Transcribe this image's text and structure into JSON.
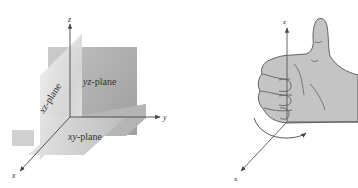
{
  "figure_left": {
    "title": "coordinate-planes",
    "axes": {
      "z_label": "z",
      "y_label": "y",
      "x_label": "x"
    },
    "planes": {
      "yz": {
        "var": "yz",
        "suffix": "-plane"
      },
      "xz": {
        "var": "xz",
        "suffix": "-plane"
      },
      "xy": {
        "var": "xy",
        "suffix": "-plane"
      }
    },
    "colors": {
      "yz_plane": "#a9a9a9",
      "xz_plane": "#d9d9d9",
      "xy_plane": "#c4c4c4",
      "axis": "#444444"
    }
  },
  "figure_right": {
    "title": "right-hand-rule",
    "axes": {
      "z_label": "z",
      "x_label": "x"
    },
    "colors": {
      "hand_fill": "#c0c0c0",
      "hand_outline": "#555555",
      "axis": "#555555"
    }
  }
}
